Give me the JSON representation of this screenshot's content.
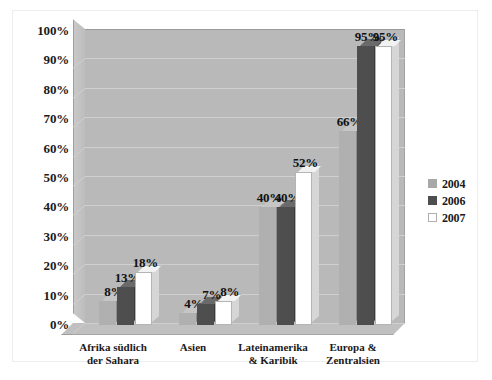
{
  "chart_data": {
    "type": "bar",
    "title": "",
    "xlabel": "",
    "ylabel": "",
    "ylim": [
      0,
      100
    ],
    "ytick_labels": [
      "100%",
      "90%",
      "80%",
      "70%",
      "60%",
      "50%",
      "40%",
      "30%",
      "20%",
      "10%",
      "0%"
    ],
    "ytick_values": [
      100,
      90,
      80,
      70,
      60,
      50,
      40,
      30,
      20,
      10,
      0
    ],
    "grid": true,
    "legend_position": "right",
    "categories": [
      "Afrika südlich der Sahara",
      "Asien",
      "Lateinamerika & Karibik",
      "Europa & Zentralsien"
    ],
    "category_lines": [
      [
        "Afrika südlich",
        "der Sahara"
      ],
      [
        "Asien",
        ""
      ],
      [
        "Lateinamerika",
        "& Karibik"
      ],
      [
        "Europa &",
        "Zentralsien"
      ]
    ],
    "series": [
      {
        "name": "2004",
        "color": "#b0b0b0",
        "values": [
          8,
          4,
          40,
          66
        ],
        "labels": [
          "8%",
          "4%",
          "40%",
          "66%"
        ]
      },
      {
        "name": "2006",
        "color": "#4e4e4e",
        "values": [
          13,
          7,
          40,
          95
        ],
        "labels": [
          "13%",
          "7%",
          "40%",
          "95%"
        ]
      },
      {
        "name": "2007",
        "color": "#ffffff",
        "values": [
          18,
          8,
          52,
          95
        ],
        "labels": [
          "18%",
          "8%",
          "52%",
          "95%"
        ]
      }
    ]
  },
  "legend": {
    "items": [
      {
        "label": "2004"
      },
      {
        "label": "2006"
      },
      {
        "label": "2007"
      }
    ]
  },
  "colors": {
    "plot_background": "#b9b9b9",
    "gridline": "#cfcfcf",
    "frame_border": "#ededed",
    "text": "#1a1a1a"
  }
}
